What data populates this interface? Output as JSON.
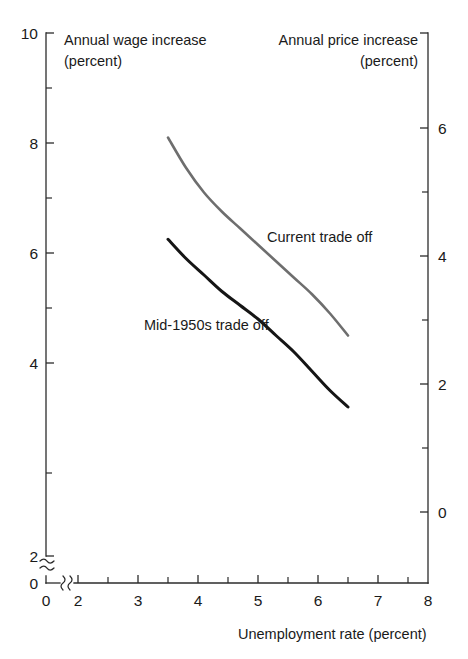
{
  "chart_data": {
    "type": "line",
    "title": "",
    "xlabel": "Unemployment rate (percent)",
    "ylabel_left": "Annual wage increase (percent)",
    "ylabel_right": "Annual price increase (percent)",
    "xlim": [
      2,
      8
    ],
    "ylim_left": [
      2,
      10
    ],
    "ylim_right": [
      0,
      6.8
    ],
    "grid": false,
    "legend_position": "inline-annotations",
    "axis_break_x": true,
    "axis_break_y": true,
    "x_ticks_major": [
      0,
      2,
      3,
      4,
      5,
      6,
      7,
      8
    ],
    "x_ticks_minor": [
      2.5,
      3.5,
      4.5,
      5.5,
      6.5,
      7.5
    ],
    "y_ticks_left_major": [
      0,
      2,
      4,
      6,
      8,
      10
    ],
    "y_ticks_left_minor": [
      3,
      5,
      7,
      9
    ],
    "y_ticks_right_major": [
      0,
      2,
      4,
      6
    ],
    "y_ticks_right_minor": [
      1,
      3,
      5
    ],
    "series": [
      {
        "name": "Current trade off",
        "color": "#6e6e6e",
        "x": [
          3.5,
          3.8,
          4.1,
          4.4,
          4.7,
          5.0,
          5.3,
          5.6,
          5.9,
          6.2,
          6.5
        ],
        "values": [
          8.1,
          7.55,
          7.1,
          6.75,
          6.45,
          6.15,
          5.85,
          5.55,
          5.25,
          4.9,
          4.5
        ],
        "label_x": 5.15,
        "label_y": 6.2
      },
      {
        "name": "Mid-1950s trade off",
        "color": "#151515",
        "x": [
          3.5,
          3.8,
          4.1,
          4.4,
          4.7,
          5.0,
          5.3,
          5.6,
          5.9,
          6.2,
          6.5
        ],
        "values": [
          6.25,
          5.9,
          5.6,
          5.3,
          5.05,
          4.8,
          4.5,
          4.2,
          3.85,
          3.5,
          3.2
        ],
        "label_x": 3.1,
        "label_y": 4.6
      }
    ]
  },
  "labels": {
    "left_axis_title_line1": "Annual wage increase",
    "left_axis_title_line2": "(percent)",
    "right_axis_title_line1": "Annual price increase",
    "right_axis_title_line2": "(percent)",
    "x_axis_title": "Unemployment rate (percent)",
    "series_1_label": "Current trade off",
    "series_2_label": "Mid-1950s trade off",
    "y_left_tick_10": "10",
    "y_left_tick_8": "8",
    "y_left_tick_6": "6",
    "y_left_tick_4": "4",
    "y_left_tick_2": "2",
    "y_left_tick_0": "0",
    "y_right_tick_6": "6",
    "y_right_tick_4": "4",
    "y_right_tick_2": "2",
    "y_right_tick_0": "0",
    "x_tick_0": "0",
    "x_tick_2": "2",
    "x_tick_3": "3",
    "x_tick_4": "4",
    "x_tick_5": "5",
    "x_tick_6": "6",
    "x_tick_7": "7",
    "x_tick_8": "8"
  },
  "colors": {
    "current_trade_off": "#6e6e6e",
    "mid_1950s_trade_off": "#151515",
    "axis": "#2b2b2b",
    "background": "#ffffff"
  }
}
